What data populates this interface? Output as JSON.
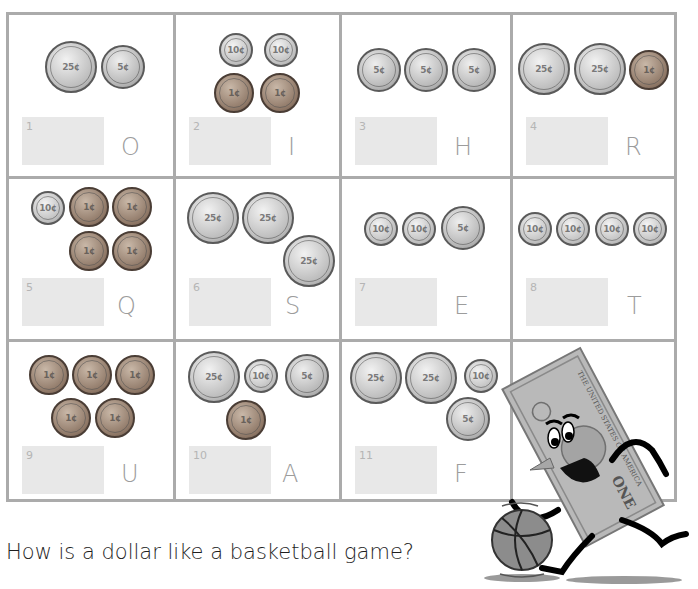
{
  "worksheet": {
    "question": "How is a dollar like a basketball game?",
    "colors": {
      "grid_border": "#ababab",
      "answer_box": "#e8e8e8",
      "letter": "#9c9c9c",
      "answer_number": "#b5b5b5",
      "question_text": "#1e1e1e"
    },
    "cells": [
      {
        "number": "1",
        "letter": "O",
        "coins": [
          "quarter",
          "nickel"
        ]
      },
      {
        "number": "2",
        "letter": "I",
        "coins": [
          "dime",
          "dime",
          "penny",
          "penny"
        ]
      },
      {
        "number": "3",
        "letter": "H",
        "coins": [
          "nickel",
          "nickel",
          "nickel"
        ]
      },
      {
        "number": "4",
        "letter": "R",
        "coins": [
          "quarter",
          "quarter",
          "penny"
        ]
      },
      {
        "number": "5",
        "letter": "Q",
        "coins": [
          "dime",
          "penny",
          "penny",
          "penny",
          "penny"
        ]
      },
      {
        "number": "6",
        "letter": "S",
        "coins": [
          "quarter",
          "quarter",
          "quarter"
        ]
      },
      {
        "number": "7",
        "letter": "E",
        "coins": [
          "dime",
          "dime",
          "nickel"
        ]
      },
      {
        "number": "8",
        "letter": "T",
        "coins": [
          "dime",
          "dime",
          "dime",
          "dime"
        ]
      },
      {
        "number": "9",
        "letter": "U",
        "coins": [
          "penny",
          "penny",
          "penny",
          "penny",
          "penny"
        ]
      },
      {
        "number": "10",
        "letter": "A",
        "coins": [
          "quarter",
          "dime",
          "nickel",
          "penny"
        ]
      },
      {
        "number": "11",
        "letter": "F",
        "coins": [
          "quarter",
          "quarter",
          "dime",
          "nickel"
        ]
      }
    ],
    "coin_labels": {
      "quarter": "25¢",
      "nickel": "5¢",
      "dime": "10¢",
      "penny": "1¢"
    },
    "illustration": {
      "subject": "dollar-bill-character-dribbling-basketball",
      "bill_text": "THE UNITED STATES OF AMERICA",
      "bill_denomination": "ONE"
    }
  }
}
